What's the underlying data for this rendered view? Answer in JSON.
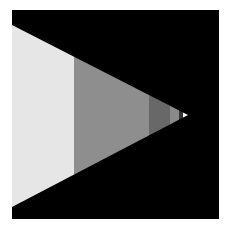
{
  "figure": {
    "background": "#ffffff",
    "panel_color": "#000000",
    "shape": "right-pointing-triangle",
    "triangle": {
      "left_x": 0,
      "top_y": 15,
      "bottom_y": 197,
      "tip_x": 175,
      "tip_y": 105
    },
    "bands": [
      {
        "x0": 0,
        "x1": 62,
        "color": "#e6e6e6"
      },
      {
        "x0": 62,
        "x1": 137,
        "color": "#8e8e8e"
      },
      {
        "x0": 137,
        "x1": 158,
        "color": "#686868"
      },
      {
        "x0": 158,
        "x1": 167,
        "color": "#8a8a8a"
      },
      {
        "x0": 167,
        "x1": 171,
        "color": "#333333"
      },
      {
        "x0": 171,
        "x1": 176,
        "color": "#ffffff"
      }
    ]
  }
}
